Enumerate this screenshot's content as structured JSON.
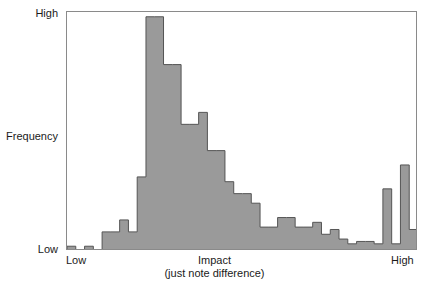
{
  "axes": {
    "y": {
      "label": "Frequency",
      "tick_high": "High",
      "tick_low": "Low"
    },
    "x": {
      "title": "Impact",
      "subtitle": "(just note difference)",
      "tick_low": "Low",
      "tick_high": "High"
    }
  },
  "style": {
    "bar_fill": "#9a9a9a",
    "bar_stroke": "#555555",
    "frame_stroke": "#8a8a8a",
    "background": "#ffffff",
    "text_color": "#1a1a1a"
  },
  "chart_data": {
    "type": "bar",
    "title": "",
    "xlabel": "Impact",
    "xlabel_sub": "(just note difference)",
    "ylabel": "Frequency",
    "xtick_labels": [
      "Low",
      "High"
    ],
    "ytick_labels": [
      "Low",
      "High"
    ],
    "ylim": [
      0,
      100
    ],
    "xlim": [
      0,
      40
    ],
    "grid": false,
    "legend": "none",
    "bin_count": 40,
    "note": "Histogram of just-noticeable-difference impact ratings; y values are percentages of the Low-to-High frequency span estimated from pixel heights.",
    "categories": [
      "b1",
      "b2",
      "b3",
      "b4",
      "b5",
      "b6",
      "b7",
      "b8",
      "b9",
      "b10",
      "b11",
      "b12",
      "b13",
      "b14",
      "b15",
      "b16",
      "b17",
      "b18",
      "b19",
      "b20",
      "b21",
      "b22",
      "b23",
      "b24",
      "b25",
      "b26",
      "b27",
      "b28",
      "b29",
      "b30",
      "b31",
      "b32",
      "b33",
      "b34",
      "b35",
      "b36",
      "b37",
      "b38",
      "b39",
      "b40"
    ],
    "values": [
      2,
      0,
      2,
      0,
      8,
      8,
      13,
      8,
      31,
      98,
      98,
      78,
      78,
      53,
      53,
      58,
      42,
      42,
      29,
      24,
      24,
      20,
      10,
      10,
      14,
      14,
      10,
      10,
      12,
      7,
      9,
      5,
      3,
      4,
      4,
      3,
      26,
      3,
      36,
      9
    ]
  }
}
